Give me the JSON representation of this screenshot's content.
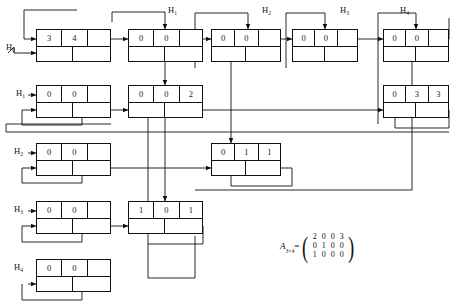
{
  "diagram": {
    "stroke_color": "#111111",
    "background": "#ffffff",
    "head_labels": [
      {
        "id": "h0-left",
        "text": "H",
        "sub": "0",
        "x": 6,
        "y": 42
      },
      {
        "id": "h1-left",
        "text": "H",
        "sub": "1",
        "x": 16,
        "y": 88
      },
      {
        "id": "h2-left",
        "text": "H",
        "sub": "2",
        "x": 14,
        "y": 146
      },
      {
        "id": "h3-left",
        "text": "H",
        "sub": "3",
        "x": 14,
        "y": 204
      },
      {
        "id": "h4-left",
        "text": "H",
        "sub": "4",
        "x": 14,
        "y": 262
      },
      {
        "id": "h1-top",
        "text": "H",
        "sub": "1",
        "x": 168,
        "y": 5
      },
      {
        "id": "h2-top",
        "text": "H",
        "sub": "2",
        "x": 262,
        "y": 5
      },
      {
        "id": "h3-top",
        "text": "H",
        "sub": "3",
        "x": 340,
        "y": 5
      },
      {
        "id": "h4-top",
        "text": "H",
        "sub": "4",
        "x": 400,
        "y": 5
      }
    ],
    "nodes": [
      {
        "id": "n-r0c0",
        "x": 36,
        "y": 29,
        "w": 75,
        "h": 33,
        "top": [
          "3",
          "4",
          ""
        ],
        "top_w": [
          26,
          26,
          23
        ],
        "bottom": [
          "",
          ""
        ],
        "bottom_w": [
          37,
          38
        ]
      },
      {
        "id": "n-r0c1",
        "x": 128,
        "y": 29,
        "w": 75,
        "h": 33,
        "top": [
          "0",
          "0",
          ""
        ],
        "top_w": [
          26,
          26,
          23
        ],
        "bottom": [
          "",
          ""
        ],
        "bottom_w": [
          37,
          38
        ]
      },
      {
        "id": "n-r0c2",
        "x": 211,
        "y": 29,
        "w": 70,
        "h": 33,
        "top": [
          "0",
          "0",
          ""
        ],
        "top_w": [
          24,
          24,
          22
        ],
        "bottom": [
          "",
          ""
        ],
        "bottom_w": [
          35,
          35
        ]
      },
      {
        "id": "n-r0c3",
        "x": 292,
        "y": 29,
        "w": 66,
        "h": 33,
        "top": [
          "0",
          "0",
          ""
        ],
        "top_w": [
          23,
          23,
          20
        ],
        "bottom": [
          "",
          ""
        ],
        "bottom_w": [
          33,
          33
        ]
      },
      {
        "id": "n-r0c4",
        "x": 383,
        "y": 29,
        "w": 66,
        "h": 33,
        "top": [
          "0",
          "0",
          ""
        ],
        "top_w": [
          23,
          23,
          20
        ],
        "bottom": [
          "",
          ""
        ],
        "bottom_w": [
          33,
          33
        ]
      },
      {
        "id": "n-r1c0",
        "x": 36,
        "y": 85,
        "w": 75,
        "h": 33,
        "top": [
          "0",
          "0",
          ""
        ],
        "top_w": [
          26,
          26,
          23
        ],
        "bottom": [
          "",
          ""
        ],
        "bottom_w": [
          37,
          38
        ]
      },
      {
        "id": "n-r1c1",
        "x": 128,
        "y": 85,
        "w": 75,
        "h": 33,
        "top": [
          "0",
          "0",
          "2"
        ],
        "top_w": [
          26,
          26,
          23
        ],
        "bottom": [
          "",
          ""
        ],
        "bottom_w": [
          37,
          38
        ]
      },
      {
        "id": "n-r1c4",
        "x": 383,
        "y": 85,
        "w": 66,
        "h": 33,
        "top": [
          "0",
          "3",
          "3"
        ],
        "top_w": [
          23,
          23,
          20
        ],
        "bottom": [
          "",
          ""
        ],
        "bottom_w": [
          33,
          33
        ]
      },
      {
        "id": "n-r2c0",
        "x": 36,
        "y": 143,
        "w": 75,
        "h": 33,
        "top": [
          "0",
          "0",
          ""
        ],
        "top_w": [
          26,
          26,
          23
        ],
        "bottom": [
          "",
          ""
        ],
        "bottom_w": [
          37,
          38
        ]
      },
      {
        "id": "n-r2c2",
        "x": 211,
        "y": 143,
        "w": 70,
        "h": 33,
        "top": [
          "0",
          "1",
          "1"
        ],
        "top_w": [
          24,
          24,
          22
        ],
        "bottom": [
          "",
          ""
        ],
        "bottom_w": [
          35,
          35
        ]
      },
      {
        "id": "n-r3c0",
        "x": 36,
        "y": 201,
        "w": 75,
        "h": 33,
        "top": [
          "0",
          "0",
          ""
        ],
        "top_w": [
          26,
          26,
          23
        ],
        "bottom": [
          "",
          ""
        ],
        "bottom_w": [
          37,
          38
        ]
      },
      {
        "id": "n-r3c1",
        "x": 128,
        "y": 201,
        "w": 75,
        "h": 33,
        "top": [
          "1",
          "0",
          "1"
        ],
        "top_w": [
          26,
          26,
          23
        ],
        "bottom": [
          "",
          ""
        ],
        "bottom_w": [
          37,
          38
        ]
      },
      {
        "id": "n-r4c0",
        "x": 36,
        "y": 259,
        "w": 75,
        "h": 33,
        "top": [
          "0",
          "0",
          ""
        ],
        "top_w": [
          26,
          26,
          23
        ],
        "bottom": [
          "",
          ""
        ],
        "bottom_w": [
          37,
          38
        ]
      }
    ],
    "matrix": {
      "name": "A",
      "name_sub": "3×4",
      "equals": "=",
      "rows": [
        [
          "2",
          "0",
          "0",
          "3"
        ],
        [
          "0",
          "1",
          "0",
          "0"
        ],
        [
          "1",
          "0",
          "0",
          "0"
        ]
      ]
    }
  }
}
